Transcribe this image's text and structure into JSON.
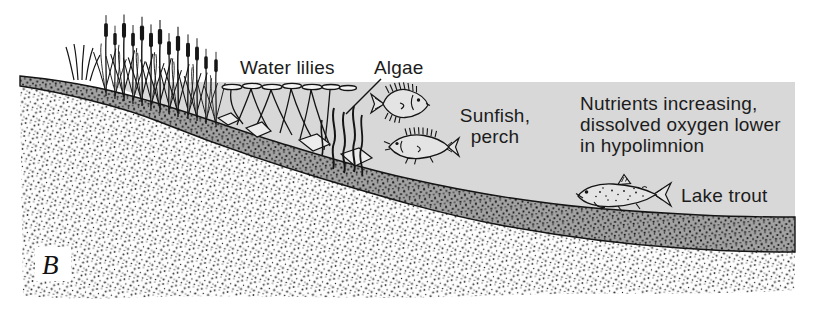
{
  "figure": {
    "panel_label": "B"
  },
  "labels": {
    "water_lilies": "Water lilies",
    "algae": "Algae",
    "sunfish_perch_line1": "Sunfish,",
    "sunfish_perch_line2": "perch",
    "nutrients_line1": "Nutrients increasing,",
    "nutrients_line2": "dissolved oxygen lower",
    "nutrients_line3": "in hypolimnion",
    "lake_trout": "Lake trout"
  },
  "colors": {
    "water": "#d8d8d8",
    "sediment_base": "#a2a2a2",
    "ink": "#1c1c1c",
    "background": "#ffffff"
  },
  "scene": {
    "illustrations": [
      "cattails-on-shore",
      "grass-tuft",
      "water-lily-pads-and-stems",
      "algae-strands",
      "rocks-on-bottom",
      "sunfish",
      "perch",
      "lake-trout",
      "water-body",
      "sediment-layer",
      "substrate-ground"
    ]
  }
}
